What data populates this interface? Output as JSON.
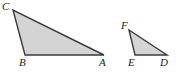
{
  "figure": {
    "background_color": "#ffffff",
    "fill_color": "#d4d4d4",
    "stroke_color": "#3a3a3a",
    "stroke_width": 1.4,
    "label_color": "#1a1a1a",
    "width": 180,
    "height": 79
  },
  "shapes": [
    {
      "name": "triangle-abc",
      "points": "13,10 25,55 104,55",
      "vertices": [
        {
          "label": "C",
          "x": 13,
          "y": 10
        },
        {
          "label": "B",
          "x": 25,
          "y": 55
        },
        {
          "label": "A",
          "x": 104,
          "y": 55
        }
      ]
    },
    {
      "name": "triangle-def",
      "points": "129,30 135,55 167,55",
      "vertices": [
        {
          "label": "F",
          "x": 129,
          "y": 30
        },
        {
          "label": "E",
          "x": 135,
          "y": 55
        },
        {
          "label": "D",
          "x": 167,
          "y": 55
        }
      ]
    }
  ],
  "labels": {
    "A": "A",
    "B": "B",
    "C": "C",
    "D": "D",
    "E": "E",
    "F": "F"
  }
}
